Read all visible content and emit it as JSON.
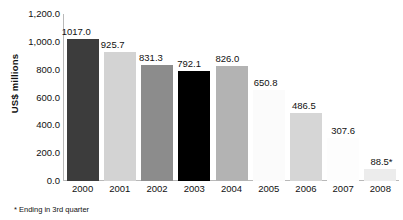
{
  "chart_data": {
    "type": "bar",
    "title": "",
    "xlabel": "",
    "ylabel": "US$ millions",
    "categories": [
      "2000",
      "2001",
      "2002",
      "2003",
      "2004",
      "2005",
      "2006",
      "2007",
      "2008"
    ],
    "values": [
      1017.0,
      925.7,
      831.3,
      792.1,
      826.0,
      650.8,
      486.5,
      307.6,
      88.5
    ],
    "value_labels": [
      "1017.0",
      "925.7",
      "831.3",
      "792.1",
      "826.0",
      "650.8",
      "486.5",
      "307.6",
      "88.5*"
    ],
    "bar_colors": [
      "#3c3c3c",
      "#d3d3d3",
      "#8c8c8c",
      "#000000",
      "#b3b3b3",
      "#fbfbfb",
      "#d6d6d6",
      "#fdfdfd",
      "#ececec"
    ],
    "ylim": [
      0,
      1200
    ],
    "yticks": [
      0,
      200,
      400,
      600,
      800,
      1000,
      1200
    ],
    "ytick_labels": [
      "0.0",
      "200.0",
      "400.0",
      "600.0",
      "800.0",
      "1,000.0",
      "1,200.0"
    ],
    "grid": false,
    "legend": "none",
    "footnote": "* Ending in 3rd quarter"
  }
}
